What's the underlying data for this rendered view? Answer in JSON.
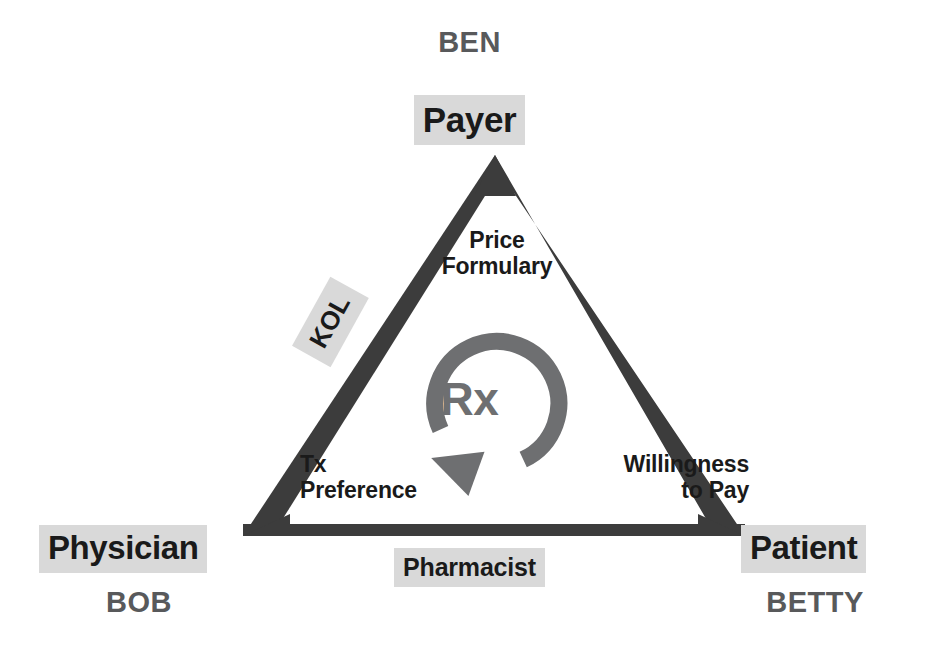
{
  "diagram": {
    "title_implicit": "Stakeholder triangle: Payer, Physician, Patient",
    "colors": {
      "triangle_stroke": "#3c3c3c",
      "chip_background": "#d9d9d9",
      "chip_text": "#1a1a1a",
      "person_name_text": "#58595b",
      "rx_arrow": "#6e6f71",
      "edge_note_text": "#1a1a1a",
      "page_background": "#ffffff"
    },
    "vertices": [
      {
        "id": "top",
        "role_label": "Payer",
        "person_name": "BEN",
        "x": 495,
        "y": 155
      },
      {
        "id": "bottom-left",
        "role_label": "Physician",
        "person_name": "BOB",
        "x": 243,
        "y": 536
      },
      {
        "id": "bottom-right",
        "role_label": "Patient",
        "person_name": "BETTY",
        "x": 745,
        "y": 536
      }
    ],
    "edge_labels": [
      {
        "id": "left-outside",
        "text": "KOL",
        "style": "chip",
        "rotation_deg": -61
      },
      {
        "id": "bottom-outside",
        "text": "Pharmacist",
        "style": "chip",
        "rotation_deg": 0
      }
    ],
    "edge_notes": [
      {
        "id": "right-upper",
        "line1": "Price",
        "line2": "Formulary",
        "align": "center"
      },
      {
        "id": "left-lower",
        "line1": "Tx",
        "line2": "Preference",
        "align": "left"
      },
      {
        "id": "right-lower",
        "line1": "Willingness",
        "line2": "to Pay",
        "align": "right"
      }
    ],
    "center": {
      "label": "Rx",
      "icon": "circular-arrow-clockwise-icon"
    }
  }
}
